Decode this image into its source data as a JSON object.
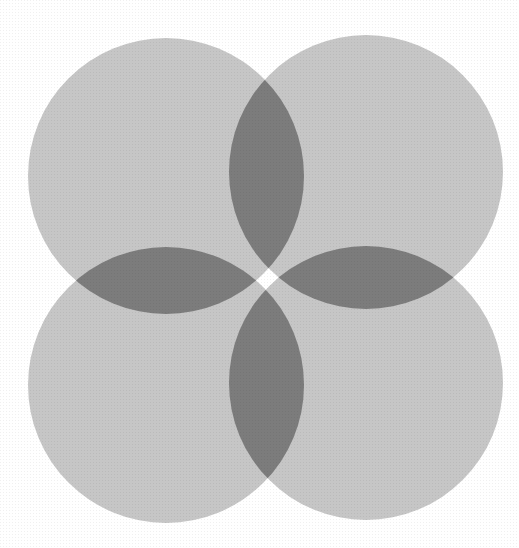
{
  "image": {
    "description": "Halftone print of four overlapping grey circles arranged in a 2x2 pattern forming a four-petal flower shape where neighbouring circles overlap",
    "subject": "four overlapping circles",
    "background_color": "#ffffff",
    "circle_fill_color": "#c6c6c6",
    "overlap_fill_color": "#7c7c7c",
    "circles": [
      {
        "name": "top-left"
      },
      {
        "name": "top-right"
      },
      {
        "name": "bottom-left"
      },
      {
        "name": "bottom-right"
      }
    ],
    "overlap_petals": [
      "top",
      "left",
      "right",
      "bottom"
    ]
  }
}
